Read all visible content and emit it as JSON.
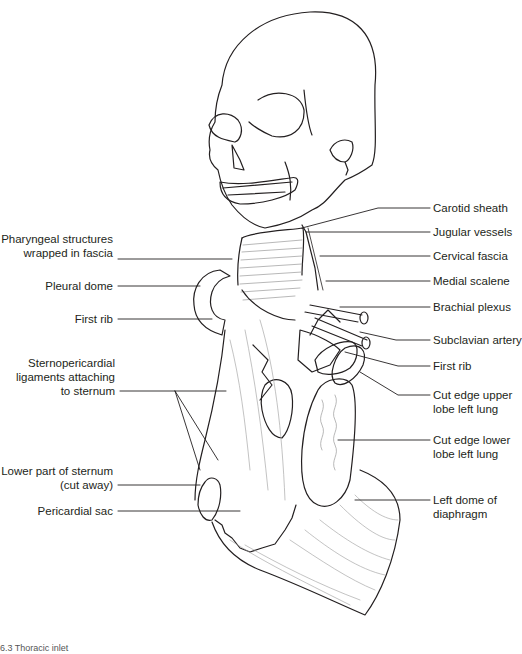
{
  "figure": {
    "line_color": "#231f20",
    "fiber_color": "#9a9a9a",
    "labels_left": [
      {
        "id": "pharyngeal",
        "line1": "Pharyngeal structures",
        "line2": "wrapped in fascia"
      },
      {
        "id": "pleural-dome",
        "line1": "Pleural dome"
      },
      {
        "id": "first-rib-left",
        "line1": "First rib"
      },
      {
        "id": "sternopericardial",
        "line1": "Sternopericardial",
        "line2": "ligaments attaching",
        "line3": "to sternum"
      },
      {
        "id": "lower-sternum",
        "line1": "Lower part of sternum",
        "line2": "(cut away)"
      },
      {
        "id": "pericardial-sac",
        "line1": "Pericardial sac"
      }
    ],
    "labels_right": [
      {
        "id": "carotid-sheath",
        "line1": "Carotid sheath"
      },
      {
        "id": "jugular-vessels",
        "line1": "Jugular vessels"
      },
      {
        "id": "cervical-fascia",
        "line1": "Cervical fascia"
      },
      {
        "id": "medial-scalene",
        "line1": "Medial scalene"
      },
      {
        "id": "brachial-plexus",
        "line1": "Brachial plexus"
      },
      {
        "id": "subclavian-artery",
        "line1": "Subclavian artery"
      },
      {
        "id": "first-rib-right",
        "line1": "First rib"
      },
      {
        "id": "cut-upper-lobe",
        "line1": "Cut edge upper",
        "line2": "lobe left lung"
      },
      {
        "id": "cut-lower-lobe",
        "line1": "Cut edge lower",
        "line2": "lobe left lung"
      },
      {
        "id": "left-diaphragm",
        "line1": "Left dome of",
        "line2": "diaphragm"
      }
    ],
    "caption": "6.3  Thoracic inlet"
  }
}
